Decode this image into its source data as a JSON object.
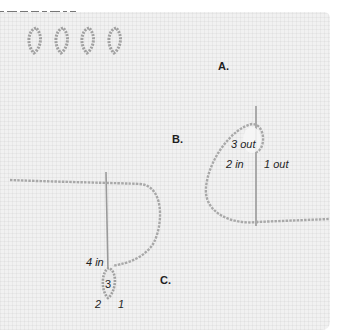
{
  "figure": {
    "stitch_icons_count": 4,
    "colors": {
      "fabric": "#f1f1f1",
      "thread": "#a8a8a8",
      "needle": "#9a9a9a",
      "text": "#1e1e1e"
    },
    "steps": [
      {
        "label": "A."
      },
      {
        "label": "B."
      },
      {
        "label": "C."
      }
    ],
    "step_b_points": {
      "p3": "3 out",
      "p2": "2 in",
      "p1": "1 out"
    },
    "step_c_points": {
      "p4": "4 in",
      "p3": "3",
      "p2": "2",
      "p1": "1"
    }
  }
}
